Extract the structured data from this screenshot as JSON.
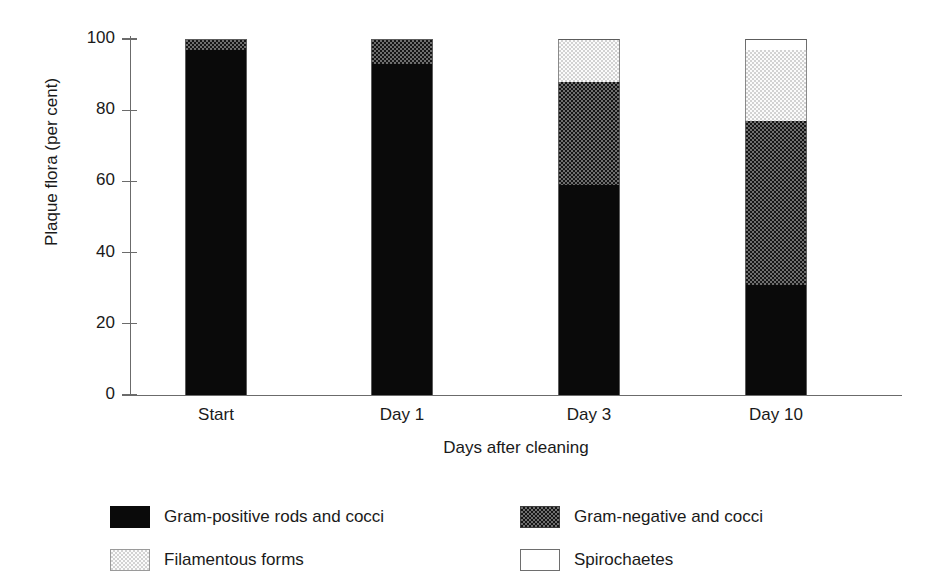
{
  "chart_data": {
    "type": "bar",
    "subtype": "stacked-bar-100",
    "title": "",
    "xlabel": "Days after cleaning",
    "ylabel": "Plaque flora (per cent)",
    "ylim": [
      0,
      100
    ],
    "yticks": [
      0,
      20,
      40,
      60,
      80,
      100
    ],
    "ytick_labels": [
      "0",
      "20",
      "40",
      "60",
      "80",
      "100"
    ],
    "grid": false,
    "legend_position": "bottom",
    "categories": [
      "Start",
      "Day 1",
      "Day 3",
      "Day 10"
    ],
    "series": [
      {
        "name": "Gram-positive rods and cocci",
        "color": "#0a0a0a",
        "pattern": "solid-black",
        "values": [
          97,
          93,
          59,
          31
        ]
      },
      {
        "name": "Gram-negative and cocci",
        "color": "#3a3a3a",
        "pattern": "dark-checker",
        "values": [
          3,
          7,
          29,
          46
        ]
      },
      {
        "name": "Filamentous forms",
        "color": "#ededed",
        "pattern": "light-checker",
        "values": [
          0,
          0,
          12,
          20
        ]
      },
      {
        "name": "Spirochaetes",
        "color": "#ffffff",
        "pattern": "white",
        "values": [
          0,
          0,
          0,
          3
        ]
      }
    ]
  },
  "axis": {
    "y_title": "Plaque flora (per cent)",
    "x_title": "Days after cleaning",
    "y_ticks": [
      "100",
      "80",
      "60",
      "40",
      "20",
      "0"
    ],
    "x_categories": [
      "Start",
      "Day 1",
      "Day 3",
      "Day 10"
    ]
  },
  "legend": {
    "items": [
      {
        "label": "Gram-positive rods and cocci",
        "swatch": "solid-black-swatch"
      },
      {
        "label": "Gram-negative and cocci",
        "swatch": "dark-checker-swatch"
      },
      {
        "label": "Filamentous forms",
        "swatch": "light-checker-swatch"
      },
      {
        "label": "Spirochaetes",
        "swatch": "white-swatch"
      }
    ]
  }
}
